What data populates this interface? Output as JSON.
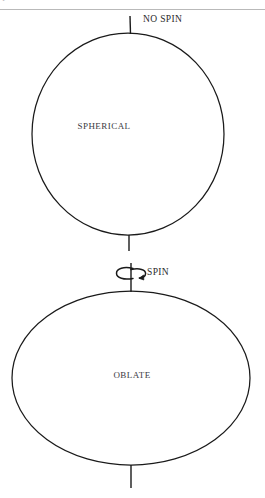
{
  "figure": {
    "header_fragment": "1 = = = = = = ",
    "panels": [
      {
        "id": "spherical",
        "body_label": "SPHERICAL",
        "spin_label": "NO SPIN",
        "shape": "circle",
        "has_spin_arrow": false,
        "geometry": {
          "center_x": 128,
          "center_y": 134,
          "radius_x": 96,
          "radius_y": 102,
          "axis_top_y": 16,
          "axis_bottom_y": 251
        }
      },
      {
        "id": "oblate",
        "body_label": "OBLATE",
        "spin_label": "SPIN",
        "shape": "ellipse",
        "has_spin_arrow": true,
        "geometry": {
          "center_x": 131,
          "center_y": 378,
          "radius_x": 119,
          "radius_y": 88,
          "axis_top_y": 263,
          "axis_bottom_y": 488
        }
      }
    ],
    "icons": {
      "spin_arrow": "rotation-arrow-icon",
      "rotation_axis": "rotation-axis-icon"
    },
    "colors": {
      "stroke": "#1a1a1a",
      "text": "#2b2b2b",
      "rule": "#b9b9b9",
      "background": "#ffffff"
    }
  }
}
